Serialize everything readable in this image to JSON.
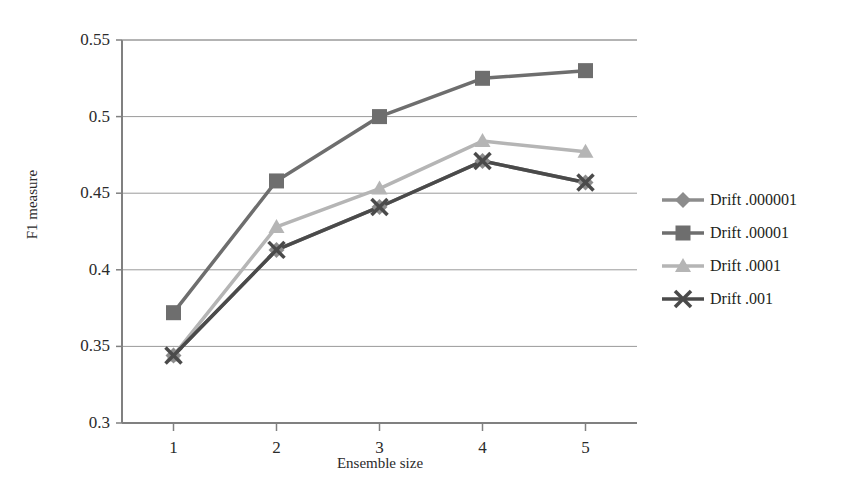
{
  "chart_data": {
    "type": "line",
    "title": "",
    "xlabel": "Ensemble size",
    "ylabel": "F1 measure",
    "x": [
      1,
      2,
      3,
      4,
      5
    ],
    "categories": [
      "1",
      "2",
      "3",
      "4",
      "5"
    ],
    "xtick_labels": [
      "1",
      "2",
      "3",
      "4",
      "5"
    ],
    "ytick_labels": [
      "0.3",
      "0.35",
      "0.4",
      "0.45",
      "0.5",
      "0.55"
    ],
    "ytick_values": [
      0.3,
      0.35,
      0.4,
      0.45,
      0.5,
      0.55
    ],
    "ylim": [
      0.3,
      0.55
    ],
    "xlim": [
      0.5,
      5.5
    ],
    "grid": "horizontal",
    "legend_position": "right",
    "series": [
      {
        "name": "Drift .000001",
        "marker": "diamond",
        "color": "#8c8c8c",
        "values": [
          0.344,
          0.413,
          0.441,
          0.471,
          0.457
        ]
      },
      {
        "name": "Drift .00001",
        "marker": "square",
        "color": "#6e6e6e",
        "values": [
          0.372,
          0.458,
          0.5,
          0.525,
          0.53
        ]
      },
      {
        "name": "Drift .0001",
        "marker": "triangle",
        "color": "#b5b5b5",
        "values": [
          0.344,
          0.428,
          0.453,
          0.484,
          0.477
        ]
      },
      {
        "name": "Drift .001",
        "marker": "x",
        "color": "#4a4a4a",
        "values": [
          0.344,
          0.413,
          0.441,
          0.471,
          0.457
        ]
      }
    ]
  },
  "axes": {
    "y_title": "F1 measure",
    "x_title": "Ensemble size",
    "y_ticks": [
      "0.55",
      "0.5",
      "0.45",
      "0.4",
      "0.35",
      "0.3"
    ],
    "x_ticks": [
      "1",
      "2",
      "3",
      "4",
      "5"
    ]
  },
  "legend": {
    "entries": [
      {
        "label": "Drift .000001",
        "marker": "diamond-marker-icon",
        "color": "#8c8c8c"
      },
      {
        "label": "Drift .00001",
        "marker": "square-marker-icon",
        "color": "#6e6e6e"
      },
      {
        "label": "Drift .0001",
        "marker": "triangle-marker-icon",
        "color": "#b5b5b5"
      },
      {
        "label": "Drift .001",
        "marker": "x-marker-icon",
        "color": "#4a4a4a"
      }
    ]
  },
  "colors": {
    "background": "#ffffff",
    "axis": "#808080",
    "gridline": "#9a9a9a",
    "text": "#231f20"
  }
}
